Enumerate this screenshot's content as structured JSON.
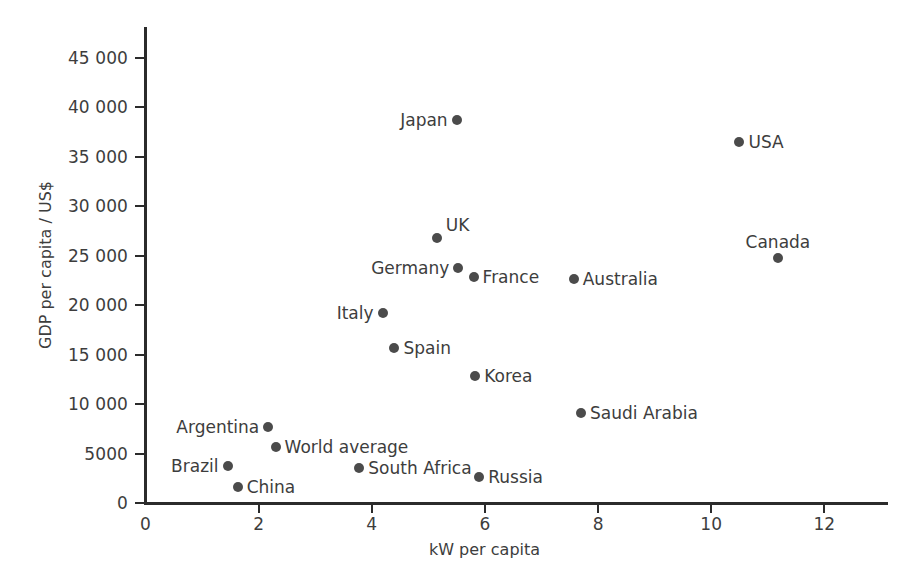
{
  "chart_data": {
    "type": "scatter",
    "title": "",
    "xlabel": "kW per capita",
    "ylabel": "GDP per capita / US$",
    "xlim": [
      0,
      12.9
    ],
    "ylim": [
      0,
      47000
    ],
    "grid": false,
    "legend": "none",
    "xticks": [
      {
        "value": 0,
        "label": "0"
      },
      {
        "value": 2,
        "label": "2"
      },
      {
        "value": 4,
        "label": "4"
      },
      {
        "value": 6,
        "label": "6"
      },
      {
        "value": 8,
        "label": "8"
      },
      {
        "value": 10,
        "label": "10"
      },
      {
        "value": 12,
        "label": "12"
      }
    ],
    "yticks": [
      {
        "value": 0,
        "label": "0"
      },
      {
        "value": 5000,
        "label": "5000"
      },
      {
        "value": 10000,
        "label": "10 000"
      },
      {
        "value": 15000,
        "label": "15 000"
      },
      {
        "value": 20000,
        "label": "20 000"
      },
      {
        "value": 25000,
        "label": "25 000"
      },
      {
        "value": 30000,
        "label": "30 000"
      },
      {
        "value": 35000,
        "label": "35 000"
      },
      {
        "value": 40000,
        "label": "40 000"
      },
      {
        "value": 45000,
        "label": "45 000"
      }
    ],
    "marker_color": "#4b4b4b",
    "axis_color": "#2b2b2b",
    "points": [
      {
        "label": "Japan",
        "x": 5.5,
        "y": 38700,
        "label_pos": "left"
      },
      {
        "label": "USA",
        "x": 10.5,
        "y": 36500,
        "label_pos": "right"
      },
      {
        "label": "Canada",
        "x": 11.18,
        "y": 24750,
        "label_pos": "above"
      },
      {
        "label": "UK",
        "x": 5.15,
        "y": 26800,
        "label_pos": "above-right"
      },
      {
        "label": "Germany",
        "x": 5.53,
        "y": 23750,
        "label_pos": "left"
      },
      {
        "label": "France",
        "x": 5.8,
        "y": 22850,
        "label_pos": "right"
      },
      {
        "label": "Australia",
        "x": 7.57,
        "y": 22600,
        "label_pos": "right"
      },
      {
        "label": "Italy",
        "x": 4.19,
        "y": 19200,
        "label_pos": "left"
      },
      {
        "label": "Spain",
        "x": 4.4,
        "y": 15650,
        "label_pos": "right"
      },
      {
        "label": "Korea",
        "x": 5.83,
        "y": 12850,
        "label_pos": "right"
      },
      {
        "label": "Saudi Arabia",
        "x": 7.7,
        "y": 9100,
        "label_pos": "right"
      },
      {
        "label": "Argentina",
        "x": 2.17,
        "y": 7700,
        "label_pos": "left"
      },
      {
        "label": "World average",
        "x": 2.3,
        "y": 5650,
        "label_pos": "right"
      },
      {
        "label": "Brazil",
        "x": 1.45,
        "y": 3750,
        "label_pos": "left"
      },
      {
        "label": "South Africa",
        "x": 3.78,
        "y": 3550,
        "label_pos": "right"
      },
      {
        "label": "Russia",
        "x": 5.9,
        "y": 2650,
        "label_pos": "right"
      },
      {
        "label": "China",
        "x": 1.63,
        "y": 1600,
        "label_pos": "right"
      }
    ]
  }
}
